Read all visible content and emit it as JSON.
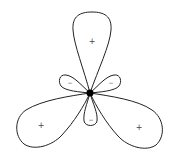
{
  "diagram": {
    "type": "hybrid-orbital-lobes",
    "nucleus": {
      "x": 90,
      "y": 93,
      "r": 3.5,
      "color": "#000000"
    },
    "large_lobes": [
      {
        "name": "top",
        "sign": "+",
        "label_x": 92,
        "label_y": 41
      },
      {
        "name": "bottom-left",
        "sign": "+",
        "label_x": 41,
        "label_y": 125
      },
      {
        "name": "bottom-right",
        "sign": "+",
        "label_x": 139,
        "label_y": 127
      }
    ],
    "small_lobes": [
      {
        "name": "upper-left",
        "sign": "−",
        "label_x": 70,
        "label_y": 82
      },
      {
        "name": "upper-right",
        "sign": "−",
        "label_x": 111,
        "label_y": 82
      },
      {
        "name": "bottom",
        "sign": "−",
        "label_x": 91,
        "label_y": 119
      }
    ],
    "stroke_color": "#222222"
  }
}
